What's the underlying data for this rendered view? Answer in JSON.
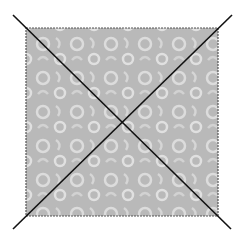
{
  "figure": {
    "title_fragment": "",
    "shape": "square",
    "fill_color": "#b9b9b9",
    "pattern_color": "#dcdcdc",
    "border_color": "#555555",
    "diagonal_color": "#111111",
    "square": {
      "x": 26,
      "y": 28,
      "size": 192
    },
    "diagonals": [
      {
        "x1": 13,
        "y1": 15,
        "x2": 231,
        "y2": 229
      },
      {
        "x1": 232,
        "y1": 15,
        "x2": 13,
        "y2": 229
      }
    ]
  }
}
